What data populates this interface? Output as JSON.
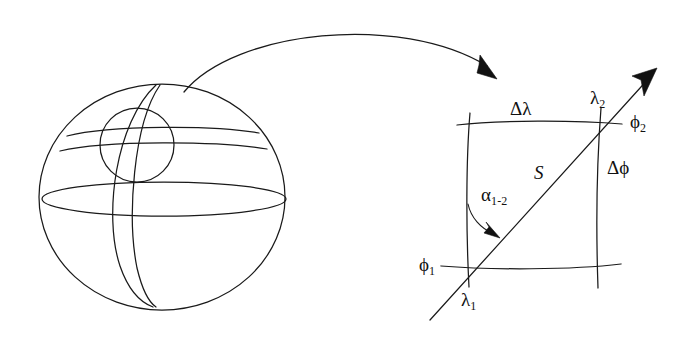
{
  "figure": {
    "background_color": "#ffffff",
    "ink_color": "#1a1a1a",
    "width": 696,
    "height": 342
  },
  "globe": {
    "name": "sphere-with-graticule",
    "outline": "circle",
    "features": [
      "outer-circle",
      "equator-ellipse",
      "latitude-arc-upper",
      "latitude-arc-lower",
      "meridian-left",
      "meridian-right",
      "detail-circle"
    ]
  },
  "callout": {
    "name": "magnifier-arrow",
    "direction": "left-to-right",
    "has_arrowhead": true
  },
  "detail": {
    "name": "graticule-cell",
    "labels": {
      "delta_lambda": {
        "base": "Δλ",
        "sub": ""
      },
      "delta_phi": {
        "base": "Δϕ",
        "sub": ""
      },
      "lambda_1": {
        "base": "λ",
        "sub": "1"
      },
      "lambda_2": {
        "base": "λ",
        "sub": "2"
      },
      "phi_1": {
        "base": "ϕ",
        "sub": "1"
      },
      "phi_2": {
        "base": "ϕ",
        "sub": "2"
      },
      "alpha_1_2": {
        "base": "α",
        "sub": "1-2"
      },
      "distance_s": {
        "base": "S",
        "sub": ""
      }
    },
    "geodesic": {
      "name": "geodesic-line",
      "from_corner": "lower-left",
      "to_corner": "upper-right",
      "has_arrowhead": true
    },
    "azimuth_arc": {
      "name": "azimuth-angle-arc",
      "has_arrowhead": true
    }
  }
}
